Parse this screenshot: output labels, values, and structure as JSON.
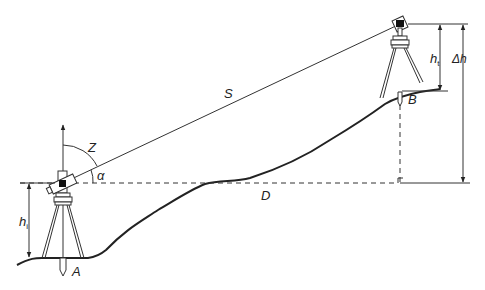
{
  "diagram": {
    "type": "trigonometric-levelling",
    "labels": {
      "slope_distance": "S",
      "horizontal_distance": "D",
      "zenith_angle": "Z",
      "vertical_angle": "α",
      "point_a": "A",
      "point_b": "B",
      "instrument_height": "h",
      "instrument_height_sub": "i",
      "target_height": "h",
      "target_height_sub": "t",
      "height_difference": "Δh"
    },
    "colors": {
      "line": "#222222",
      "background": "#ffffff"
    }
  }
}
